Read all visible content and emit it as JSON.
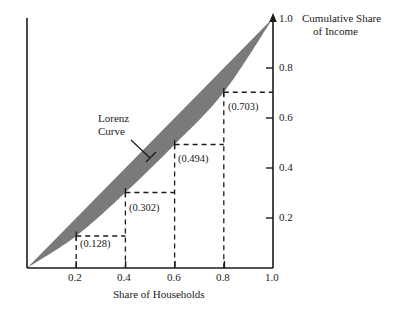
{
  "chart_data": {
    "type": "line",
    "title": "",
    "xlabel": "Share of Households",
    "ylabel": "Cumulative Share of Income",
    "ylabel_line1": "Cumulative Share",
    "ylabel_line2": "of Income",
    "xlim": [
      0.0,
      1.0
    ],
    "ylim": [
      0.0,
      1.0
    ],
    "xticks": [
      "0.2",
      "0.4",
      "0.6",
      "0.8",
      "1.0"
    ],
    "xtick_values": [
      0.2,
      0.4,
      0.6,
      0.8,
      1.0
    ],
    "yticks": [
      "0.2",
      "0.4",
      "0.6",
      "0.8",
      "1.0"
    ],
    "ytick_values": [
      0.2,
      0.4,
      0.6,
      0.8,
      1.0
    ],
    "grid": false,
    "legend": "none",
    "y_axis_position": "right",
    "series": [
      {
        "name": "Line of Equality",
        "x": [
          0.0,
          1.0
        ],
        "values": [
          0.0,
          1.0
        ]
      },
      {
        "name": "Lorenz Curve",
        "x": [
          0.0,
          0.2,
          0.4,
          0.6,
          0.8,
          1.0
        ],
        "values": [
          0.0,
          0.128,
          0.302,
          0.494,
          0.703,
          1.0
        ]
      }
    ],
    "shaded_region": {
      "name": "inequality-gap",
      "color": "#7a7a7a"
    },
    "annotations": [
      {
        "name": "curve-label",
        "text_line1": "Lorenz",
        "text_line2": "Curve"
      },
      {
        "name": "point-label-1",
        "text": "(0.128)",
        "x": 0.2,
        "y": 0.128
      },
      {
        "name": "point-label-2",
        "text": "(0.302)",
        "x": 0.4,
        "y": 0.302
      },
      {
        "name": "point-label-3",
        "text": "(0.494)",
        "x": 0.6,
        "y": 0.494
      },
      {
        "name": "point-label-4",
        "text": "(0.703)",
        "x": 0.8,
        "y": 0.703
      }
    ]
  },
  "axes": {
    "x_title": "Share of Households",
    "y_title_line1": "Cumulative Share",
    "y_title_line2": "of Income",
    "x_tick_labels": [
      "0.2",
      "0.4",
      "0.6",
      "0.8",
      "1.0"
    ],
    "y_tick_labels": [
      "0.2",
      "0.4",
      "0.6",
      "0.8",
      "1.0"
    ]
  },
  "annotations": {
    "curve_name_line1": "Lorenz",
    "curve_name_line2": "Curve",
    "point_1": "(0.128)",
    "point_2": "(0.302)",
    "point_3": "(0.494)",
    "point_4": "(0.703)"
  },
  "colors": {
    "shade": "#7a7a7a",
    "axis": "#1a1a1a",
    "text": "#1a1a1a"
  }
}
